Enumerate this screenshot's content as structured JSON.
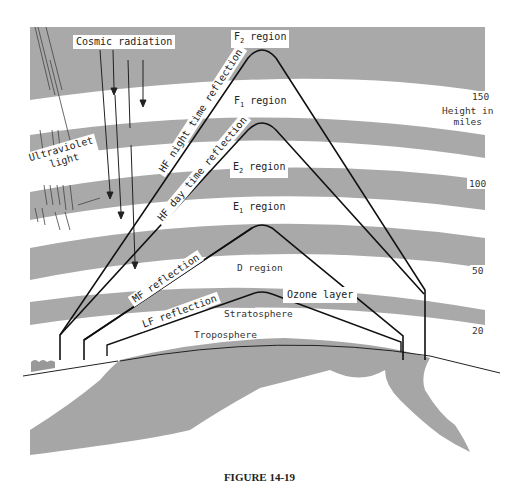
{
  "figure": {
    "caption": "FIGURE 14-19",
    "colors": {
      "band": "#a9a9a9",
      "earth": "#a6a6a6",
      "path": "#111111",
      "background": "#ffffff"
    }
  },
  "regions": {
    "f2": {
      "letter": "F",
      "sub": "2",
      "word": "region"
    },
    "f1": {
      "letter": "F",
      "sub": "1",
      "word": "region"
    },
    "e2": {
      "letter": "E",
      "sub": "2",
      "word": "region"
    },
    "e1": {
      "letter": "E",
      "sub": "1",
      "word": "region"
    },
    "d": "D region",
    "ozone": "Ozone layer",
    "stratosphere": "Stratosphere",
    "troposphere": "Troposphere"
  },
  "sources": {
    "cosmic": "Cosmic radiation",
    "uv_line1": "Ultraviolet",
    "uv_line2": "light"
  },
  "paths": {
    "hf_night": "HF night time reflection",
    "hf_day": "HF day time reflection",
    "mf": "MF reflection",
    "lf": "LF reflection"
  },
  "scale": {
    "title_line1": "Height in",
    "title_line2": "miles",
    "ticks": [
      "150",
      "100",
      "50",
      "20"
    ]
  }
}
